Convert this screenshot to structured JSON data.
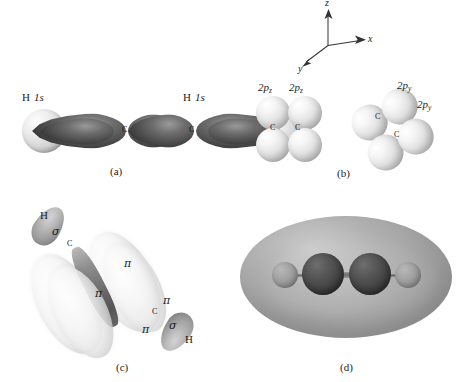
{
  "figure": {
    "background_color": "#ffffff"
  },
  "axes": {
    "z_label": "z",
    "x_label": "x",
    "y_label": "y"
  },
  "panels": [
    {
      "id": "a",
      "caption": "(a)",
      "description": "sigma framework of sp hybrid orbitals overlapping with hydrogen 1s orbitals",
      "labels": {
        "h_left": "H",
        "h_left_orbital": "1s",
        "h_right": "H",
        "h_right_orbital": "1s",
        "carbon_left": "C",
        "carbon_right": "C"
      }
    },
    {
      "id": "b",
      "caption": "(b)",
      "description": "unhybridized 2p orbitals on the two carbon atoms",
      "left_group": {
        "orbital_label_1": "2p",
        "orbital_sub_1": "z",
        "orbital_label_2": "2p",
        "orbital_sub_2": "z",
        "carbon_1": "C",
        "carbon_2": "C"
      },
      "right_group": {
        "orbital_label_1": "2p",
        "orbital_sub_1": "y",
        "orbital_label_2": "2p",
        "orbital_sub_2": "y",
        "carbon_1": "C",
        "carbon_2": "C"
      }
    },
    {
      "id": "c",
      "caption": "(c)",
      "description": "sigma and pi bonds of the carbon-carbon triple bond",
      "labels": {
        "h_top": "H",
        "sigma_top": "σ",
        "h_bottom": "H",
        "sigma_bottom": "σ",
        "pi_1": "π",
        "pi_2": "π",
        "pi_3": "π",
        "pi_4": "π",
        "carbon_top": "C",
        "carbon_bottom": "C"
      }
    },
    {
      "id": "d",
      "caption": "(d)",
      "description": "overall electron charge cloud of the acetylene molecule",
      "atoms": [
        {
          "element": "H",
          "type": "hydrogen"
        },
        {
          "element": "C",
          "type": "carbon"
        },
        {
          "element": "C",
          "type": "carbon"
        },
        {
          "element": "H",
          "type": "hydrogen"
        }
      ]
    }
  ],
  "colors": {
    "hydrogen_sphere": "#e6e6e6",
    "carbon_lobe": "#4a4a4a",
    "p_orbital": "#e8e8e8",
    "pi_cloud": "#f2f2f2",
    "sigma_lobe": "#a0a0a0",
    "charge_cloud": "#a3a3a3",
    "carbon_atom_d": "#474747",
    "hydrogen_atom_d": "#989898",
    "text": "#1c1c1c"
  }
}
